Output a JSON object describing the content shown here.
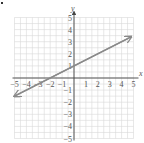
{
  "chart_data": {
    "type": "line",
    "title": "",
    "xlabel": "x",
    "ylabel": "y",
    "xlim": [
      -5,
      5
    ],
    "ylim": [
      -5,
      5
    ],
    "grid": true,
    "x_ticks": [
      "−5",
      "−4",
      "−3",
      "−2",
      "−1",
      "1",
      "2",
      "3",
      "4",
      "5"
    ],
    "y_ticks": [
      "5",
      "4",
      "3",
      "2",
      "1",
      "−1",
      "−2",
      "−3",
      "−4",
      "−5"
    ],
    "series": [
      {
        "name": "line",
        "equation": "y = 0.5x + 1",
        "slope": 0.5,
        "intercept": 1,
        "x": [
          -5,
          4.8
        ],
        "y": [
          -1.5,
          3.4
        ],
        "arrows": "both",
        "color": "#8a8a8a"
      }
    ]
  },
  "colors": {
    "grid": "#d9d9d9",
    "axis": "#444444",
    "line": "#8a8a8a"
  }
}
